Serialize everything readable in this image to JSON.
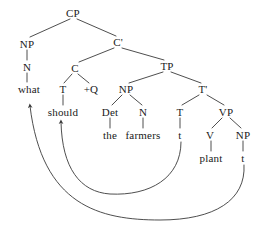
{
  "figure": {
    "type": "syntax-tree",
    "sentence": "what should the farmers plant",
    "background_color": "#ffffff",
    "line_color": "#3a3a3a",
    "text_color": "#1a1a1a"
  },
  "nodes": [
    {
      "id": "cp",
      "label": "CP",
      "x": 73,
      "y": 13,
      "kind": "phrasal"
    },
    {
      "id": "np1",
      "label": "NP",
      "x": 27,
      "y": 44,
      "kind": "phrasal"
    },
    {
      "id": "cbar",
      "label": "C'",
      "x": 118,
      "y": 42,
      "kind": "bar"
    },
    {
      "id": "n1",
      "label": "N",
      "x": 27,
      "y": 67,
      "kind": "head"
    },
    {
      "id": "c",
      "label": "C",
      "x": 75,
      "y": 68,
      "kind": "head"
    },
    {
      "id": "tp",
      "label": "TP",
      "x": 167,
      "y": 66,
      "kind": "phrasal"
    },
    {
      "id": "what",
      "label": "what",
      "x": 29,
      "y": 89,
      "kind": "terminal"
    },
    {
      "id": "t_in_c",
      "label": "T",
      "x": 63,
      "y": 89,
      "kind": "head"
    },
    {
      "id": "plusq",
      "label": "+Q",
      "x": 91,
      "y": 89,
      "kind": "feature"
    },
    {
      "id": "np2",
      "label": "NP",
      "x": 126,
      "y": 89,
      "kind": "phrasal"
    },
    {
      "id": "tbar",
      "label": "T'",
      "x": 203,
      "y": 89,
      "kind": "bar"
    },
    {
      "id": "should",
      "label": "should",
      "x": 63,
      "y": 112,
      "kind": "terminal"
    },
    {
      "id": "det",
      "label": "Det",
      "x": 110,
      "y": 112,
      "kind": "head"
    },
    {
      "id": "n2",
      "label": "N",
      "x": 143,
      "y": 112,
      "kind": "head"
    },
    {
      "id": "t_low",
      "label": "T",
      "x": 180,
      "y": 112,
      "kind": "head"
    },
    {
      "id": "vp",
      "label": "VP",
      "x": 226,
      "y": 112,
      "kind": "phrasal"
    },
    {
      "id": "the",
      "label": "the",
      "x": 110,
      "y": 135,
      "kind": "terminal"
    },
    {
      "id": "farmers",
      "label": "farmers",
      "x": 143,
      "y": 135,
      "kind": "terminal"
    },
    {
      "id": "t_trace",
      "label": "t",
      "x": 180,
      "y": 135,
      "kind": "trace"
    },
    {
      "id": "v",
      "label": "V",
      "x": 210,
      "y": 135,
      "kind": "head"
    },
    {
      "id": "np3",
      "label": "NP",
      "x": 243,
      "y": 135,
      "kind": "phrasal"
    },
    {
      "id": "plant",
      "label": "plant",
      "x": 211,
      "y": 158,
      "kind": "terminal"
    },
    {
      "id": "np_trace",
      "label": "t",
      "x": 243,
      "y": 158,
      "kind": "trace"
    }
  ],
  "branches": [
    {
      "from": "cp",
      "to": "np1"
    },
    {
      "from": "cp",
      "to": "cbar"
    },
    {
      "from": "np1",
      "to": "n1"
    },
    {
      "from": "cbar",
      "to": "c"
    },
    {
      "from": "cbar",
      "to": "tp"
    },
    {
      "from": "n1",
      "to": "what"
    },
    {
      "from": "c",
      "to": "t_in_c"
    },
    {
      "from": "c",
      "to": "plusq"
    },
    {
      "from": "tp",
      "to": "np2"
    },
    {
      "from": "tp",
      "to": "tbar"
    },
    {
      "from": "t_in_c",
      "to": "should"
    },
    {
      "from": "np2",
      "to": "det"
    },
    {
      "from": "np2",
      "to": "n2"
    },
    {
      "from": "tbar",
      "to": "t_low"
    },
    {
      "from": "tbar",
      "to": "vp"
    },
    {
      "from": "det",
      "to": "the"
    },
    {
      "from": "n2",
      "to": "farmers"
    },
    {
      "from": "t_low",
      "to": "t_trace"
    },
    {
      "from": "vp",
      "to": "v"
    },
    {
      "from": "vp",
      "to": "np3"
    },
    {
      "from": "v",
      "to": "plant"
    },
    {
      "from": "np3",
      "to": "np_trace"
    }
  ],
  "movements": [
    {
      "id": "t-to-c",
      "name": "head-movement-T-to-C",
      "source": "t_trace",
      "target": "should",
      "label": ""
    },
    {
      "id": "wh-movement",
      "name": "wh-movement-NP-to-spec-CP",
      "source": "np_trace",
      "target": "what",
      "label": ""
    }
  ]
}
